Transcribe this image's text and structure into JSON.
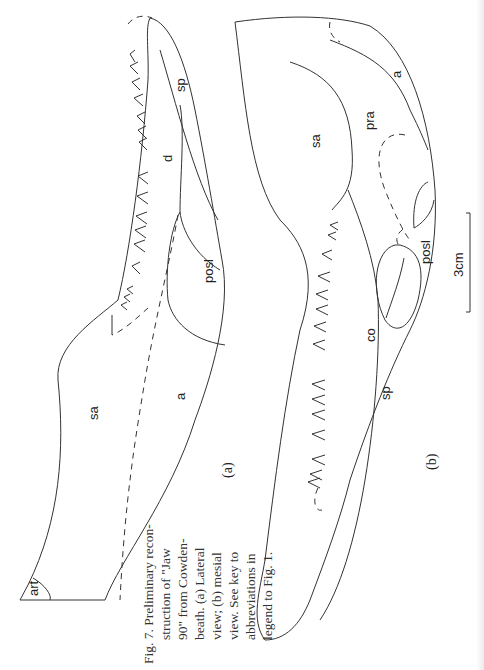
{
  "figure": {
    "number": "Fig. 7.",
    "caption_lines": [
      "Fig. 7. Preliminary recon-",
      "struction of \"Jaw",
      "90\" from Cowden-",
      "beath. (a) Lateral",
      "view; (b) mesial",
      "view. See key to",
      "abbreviations in",
      "legend to Fig. 1."
    ],
    "panel_a": {
      "label": "(a)",
      "view": "Lateral view",
      "bone_labels": {
        "art": "art",
        "sa": "sa",
        "a": "a",
        "posl": "posl",
        "d": "d",
        "sp": "sp"
      }
    },
    "panel_b": {
      "label": "(b)",
      "view": "mesial view",
      "bone_labels": {
        "sa": "sa",
        "pra": "pra",
        "a": "a",
        "posl": "posl",
        "co": "co",
        "sp": "sp"
      }
    },
    "scale_bar": {
      "label": "3cm"
    }
  }
}
